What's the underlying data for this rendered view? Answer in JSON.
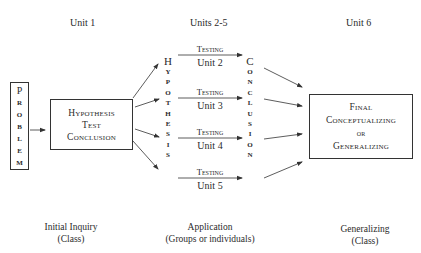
{
  "headers": {
    "col1": "Unit 1",
    "col2": "Units 2-5",
    "col3": "Unit 6"
  },
  "problem_box": {
    "letters": [
      "P",
      "R",
      "O",
      "B",
      "L",
      "E",
      "M"
    ]
  },
  "hypothesis_box": {
    "lines": [
      "Hypothesis",
      "Test",
      "Conclusion"
    ]
  },
  "hypothesis_vertical": {
    "letters": [
      "H",
      "Y",
      "P",
      "O",
      "T",
      "H",
      "E",
      "S",
      "I",
      "S"
    ]
  },
  "conclusion_vertical": {
    "letters": [
      "C",
      "O",
      "N",
      "C",
      "L",
      "U",
      "S",
      "I",
      "O",
      "N"
    ]
  },
  "testing_units": [
    {
      "label": "Testing",
      "unit": "Unit 2"
    },
    {
      "label": "Testing",
      "unit": "Unit 3"
    },
    {
      "label": "Testing",
      "unit": "Unit 4"
    },
    {
      "label": "Testing",
      "unit": "Unit 5"
    }
  ],
  "final_box": {
    "lines": [
      "Final",
      "Conceptualizing",
      "or",
      "Generalizing"
    ]
  },
  "footers": {
    "col1": {
      "line1": "Initial Inquiry",
      "line2": "(Class)"
    },
    "col2": {
      "line1": "Application",
      "line2": "(Groups or individuals)"
    },
    "col3": {
      "line1": "Generalizing",
      "line2": "(Class)"
    }
  },
  "colors": {
    "ink": "#2a2a2a",
    "background": "#ffffff"
  }
}
